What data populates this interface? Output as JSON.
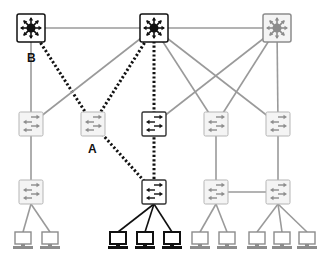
{
  "colors": {
    "active": "#111111",
    "inactive": "#8c8c8c",
    "inactive_link": "#9a9a9a",
    "node_fill": "#ffffff",
    "inactive_node_fill": "#f4f4f4"
  },
  "labels": {
    "A": "A",
    "B": "B"
  },
  "nodes": [
    {
      "id": "core1",
      "type": "core-switch",
      "layer": "core",
      "state": "active"
    },
    {
      "id": "core2",
      "type": "core-switch",
      "layer": "core",
      "state": "active"
    },
    {
      "id": "core3",
      "type": "core-switch",
      "layer": "core",
      "state": "inactive"
    },
    {
      "id": "dist1",
      "type": "switch",
      "layer": "distribution",
      "state": "inactive"
    },
    {
      "id": "dist2",
      "type": "switch",
      "layer": "distribution",
      "state": "inactive",
      "label": "A"
    },
    {
      "id": "dist3",
      "type": "switch",
      "layer": "distribution",
      "state": "active"
    },
    {
      "id": "dist4",
      "type": "switch",
      "layer": "distribution",
      "state": "inactive"
    },
    {
      "id": "dist5",
      "type": "switch",
      "layer": "distribution",
      "state": "inactive"
    },
    {
      "id": "acc1",
      "type": "switch",
      "layer": "access",
      "state": "inactive"
    },
    {
      "id": "acc2",
      "type": "switch",
      "layer": "access",
      "state": "active"
    },
    {
      "id": "acc3",
      "type": "switch",
      "layer": "access",
      "state": "inactive"
    },
    {
      "id": "acc4",
      "type": "switch",
      "layer": "access",
      "state": "inactive"
    },
    {
      "id": "pc1",
      "type": "pc",
      "layer": "host",
      "state": "inactive"
    },
    {
      "id": "pc2",
      "type": "pc",
      "layer": "host",
      "state": "inactive"
    },
    {
      "id": "pc3",
      "type": "pc",
      "layer": "host",
      "state": "active"
    },
    {
      "id": "pc4",
      "type": "pc",
      "layer": "host",
      "state": "active"
    },
    {
      "id": "pc5",
      "type": "pc",
      "layer": "host",
      "state": "active"
    },
    {
      "id": "pc6",
      "type": "pc",
      "layer": "host",
      "state": "inactive"
    },
    {
      "id": "pc7",
      "type": "pc",
      "layer": "host",
      "state": "inactive"
    },
    {
      "id": "pc8",
      "type": "pc",
      "layer": "host",
      "state": "inactive"
    },
    {
      "id": "pc9",
      "type": "pc",
      "layer": "host",
      "state": "inactive"
    },
    {
      "id": "pc10",
      "type": "pc",
      "layer": "host",
      "state": "inactive"
    }
  ],
  "links": [
    {
      "from": "core1",
      "to": "core2",
      "style": "solid",
      "label": ""
    },
    {
      "from": "core2",
      "to": "core3",
      "style": "solid",
      "label": ""
    },
    {
      "from": "core1",
      "to": "dist1",
      "style": "solid",
      "label": "B"
    },
    {
      "from": "core1",
      "to": "dist2",
      "style": "dotted",
      "label": ""
    },
    {
      "from": "core2",
      "to": "dist1",
      "style": "solid",
      "label": ""
    },
    {
      "from": "core2",
      "to": "dist2",
      "style": "dotted",
      "label": ""
    },
    {
      "from": "core2",
      "to": "dist3",
      "style": "dotted",
      "label": ""
    },
    {
      "from": "core2",
      "to": "dist4",
      "style": "solid",
      "label": ""
    },
    {
      "from": "core2",
      "to": "dist5",
      "style": "solid",
      "label": ""
    },
    {
      "from": "core3",
      "to": "dist3",
      "style": "solid",
      "label": ""
    },
    {
      "from": "core3",
      "to": "dist4",
      "style": "solid",
      "label": ""
    },
    {
      "from": "core3",
      "to": "dist5",
      "style": "solid",
      "label": ""
    },
    {
      "from": "dist1",
      "to": "acc1",
      "style": "solid",
      "label": ""
    },
    {
      "from": "dist2",
      "to": "acc2",
      "style": "dotted",
      "label": ""
    },
    {
      "from": "dist3",
      "to": "acc2",
      "style": "dotted",
      "label": ""
    },
    {
      "from": "dist4",
      "to": "acc3",
      "style": "solid",
      "label": ""
    },
    {
      "from": "dist5",
      "to": "acc4",
      "style": "solid",
      "label": ""
    },
    {
      "from": "acc3",
      "to": "acc4",
      "style": "solid",
      "label": ""
    },
    {
      "from": "acc1",
      "to": "pc1",
      "style": "solid",
      "label": ""
    },
    {
      "from": "acc1",
      "to": "pc2",
      "style": "solid",
      "label": ""
    },
    {
      "from": "acc2",
      "to": "pc3",
      "style": "solid",
      "label": ""
    },
    {
      "from": "acc2",
      "to": "pc4",
      "style": "solid",
      "label": ""
    },
    {
      "from": "acc2",
      "to": "pc5",
      "style": "solid",
      "label": ""
    },
    {
      "from": "acc3",
      "to": "pc6",
      "style": "solid",
      "label": ""
    },
    {
      "from": "acc3",
      "to": "pc7",
      "style": "solid",
      "label": ""
    },
    {
      "from": "acc4",
      "to": "pc8",
      "style": "solid",
      "label": ""
    },
    {
      "from": "acc4",
      "to": "pc9",
      "style": "solid",
      "label": ""
    },
    {
      "from": "acc4",
      "to": "pc10",
      "style": "solid",
      "label": ""
    }
  ]
}
